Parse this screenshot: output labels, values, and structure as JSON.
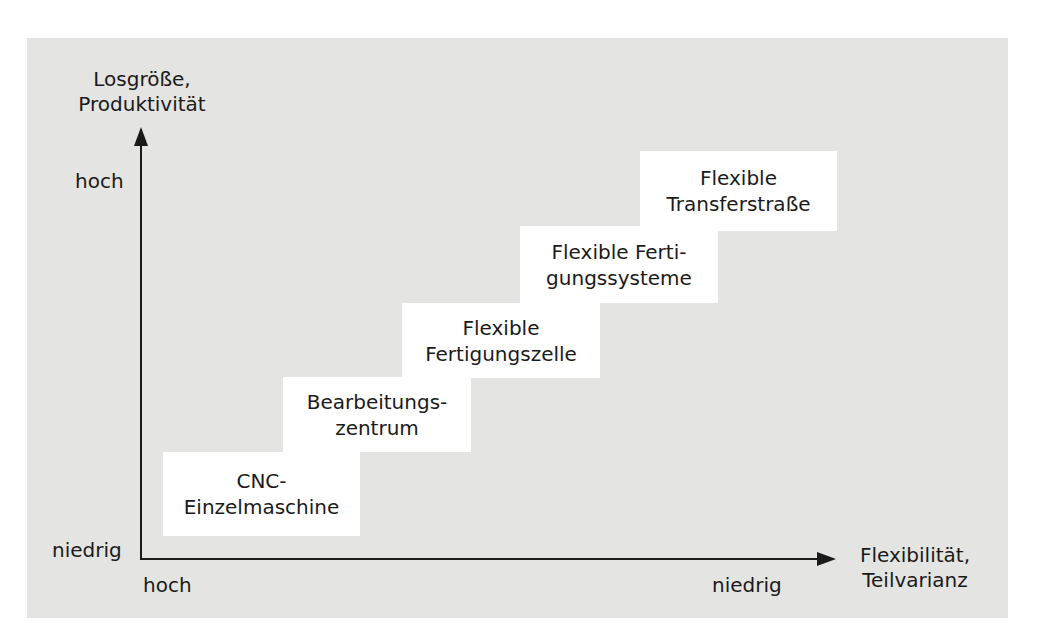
{
  "diagram": {
    "y_axis": {
      "title_lines": [
        "Losgröße,",
        "Produktivität"
      ],
      "high_label": "hoch",
      "low_label": "niedrig"
    },
    "x_axis": {
      "title_lines": [
        "Flexibilität,",
        "Teilvarianz"
      ],
      "start_label": "hoch",
      "end_label": "niedrig"
    },
    "steps": [
      {
        "lines": [
          "CNC-",
          "Einzelmaschine"
        ]
      },
      {
        "lines": [
          "Bearbeitungs-",
          "zentrum"
        ]
      },
      {
        "lines": [
          "Flexible",
          "Fertigungszelle"
        ]
      },
      {
        "lines": [
          "Flexible Ferti-",
          "gungssysteme"
        ]
      },
      {
        "lines": [
          "Flexible",
          "Transferstraße"
        ]
      }
    ],
    "colors": {
      "panel_background": "#e4e4e2",
      "box_background": "#ffffff",
      "axis": "#1a1a1a"
    }
  }
}
